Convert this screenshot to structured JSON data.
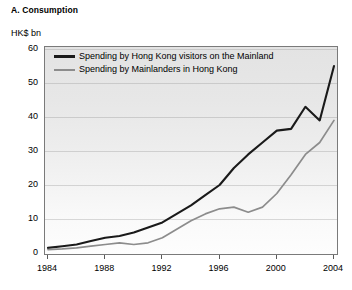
{
  "panel": {
    "title": "A. Consumption",
    "unit_label": "HK$ bn"
  },
  "legend": {
    "position": "top-left-inside",
    "entries": [
      {
        "label": "Spending by Hong Kong visitors on the Mainland",
        "color": "#1a1a1a"
      },
      {
        "label": "Spending by Mainlanders in Hong Kong",
        "color": "#8c8c8c"
      }
    ]
  },
  "axes": {
    "y_ticks": [
      "0",
      "10",
      "20",
      "30",
      "40",
      "50",
      "60"
    ],
    "x_ticks": [
      "1984",
      "1988",
      "1992",
      "1996",
      "2000",
      "2004"
    ]
  },
  "chart_data": {
    "type": "line",
    "title": "A. Consumption",
    "xlabel": "",
    "ylabel": "HK$ bn",
    "xlim": [
      1984,
      2004
    ],
    "ylim": [
      0,
      60
    ],
    "ytick_values": [
      0,
      10,
      20,
      30,
      40,
      50,
      60
    ],
    "xtick_values": [
      1984,
      1988,
      1992,
      1996,
      2000,
      2004
    ],
    "grid": true,
    "legend_position": "upper left",
    "x": [
      1984,
      1985,
      1986,
      1987,
      1988,
      1989,
      1990,
      1991,
      1992,
      1993,
      1994,
      1995,
      1996,
      1997,
      1998,
      1999,
      2000,
      2001,
      2002,
      2003,
      2004
    ],
    "series": [
      {
        "name": "Spending by Hong Kong visitors on the Mainland",
        "color": "#1a1a1a",
        "values": [
          1.5,
          2.0,
          2.5,
          3.5,
          4.5,
          5.0,
          6.0,
          7.5,
          9.0,
          11.5,
          14.0,
          17.0,
          20.0,
          25.0,
          29.0,
          32.5,
          36.0,
          36.5,
          43.0,
          39.0,
          55.0
        ]
      },
      {
        "name": "Spending by Mainlanders in Hong Kong",
        "color": "#8c8c8c",
        "values": [
          1.0,
          1.2,
          1.5,
          2.0,
          2.5,
          3.0,
          2.5,
          3.0,
          4.5,
          7.0,
          9.5,
          11.5,
          13.0,
          13.5,
          12.0,
          13.5,
          17.5,
          23.0,
          29.0,
          32.5,
          39.0
        ]
      }
    ]
  }
}
